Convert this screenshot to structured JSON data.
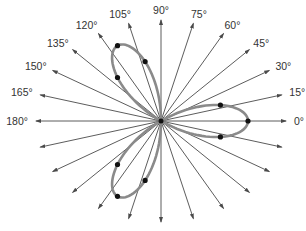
{
  "diagram": {
    "type": "polar-rose",
    "equation": "r = cos(3θ)",
    "center": [
      161,
      121
    ],
    "petal_radius_px": 87,
    "ray_radius_x_px": 125,
    "ray_radius_y_px": 101,
    "colors": {
      "ray": "#4a4a4a",
      "petal": "#8a8a8a",
      "point": "#111111",
      "label": "#333333"
    },
    "ray_angles_deg": [
      0,
      15,
      30,
      45,
      60,
      75,
      90,
      105,
      120,
      135,
      150,
      165,
      180,
      195,
      210,
      225,
      240,
      255,
      270,
      285,
      300,
      315,
      330,
      345
    ],
    "labels": [
      {
        "angle": 0,
        "text": "0°"
      },
      {
        "angle": 15,
        "text": "15°"
      },
      {
        "angle": 30,
        "text": "30°"
      },
      {
        "angle": 45,
        "text": "45°"
      },
      {
        "angle": 60,
        "text": "60°"
      },
      {
        "angle": 75,
        "text": "75°"
      },
      {
        "angle": 90,
        "text": "90°"
      },
      {
        "angle": 105,
        "text": "105°"
      },
      {
        "angle": 120,
        "text": "120°"
      },
      {
        "angle": 135,
        "text": "135°"
      },
      {
        "angle": 150,
        "text": "150°"
      },
      {
        "angle": 165,
        "text": "165°"
      },
      {
        "angle": 180,
        "text": "180°"
      }
    ],
    "marked_points_deg": [
      -15,
      0,
      15,
      105,
      120,
      135,
      225,
      240,
      255
    ]
  }
}
